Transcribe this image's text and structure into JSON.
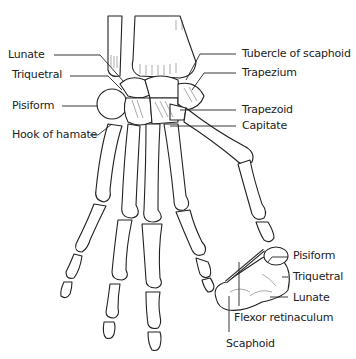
{
  "diagram": {
    "labels_left": [
      {
        "text": "Lunate",
        "x": 8,
        "y": 49
      },
      {
        "text": "Triquetral",
        "x": 12,
        "y": 69
      },
      {
        "text": "Pisiform",
        "x": 12,
        "y": 100
      },
      {
        "text": "Hook of hamate",
        "x": 12,
        "y": 129
      }
    ],
    "labels_right": [
      {
        "text": "Tubercle of scaphoid",
        "x": 242,
        "y": 48
      },
      {
        "text": "Trapezium",
        "x": 242,
        "y": 67
      },
      {
        "text": "Trapezoid",
        "x": 242,
        "y": 104
      },
      {
        "text": "Capitate",
        "x": 242,
        "y": 120
      }
    ],
    "labels_inset": [
      {
        "text": "Pisiform",
        "x": 293,
        "y": 250
      },
      {
        "text": "Triquetral",
        "x": 293,
        "y": 271
      },
      {
        "text": "Lunate",
        "x": 293,
        "y": 292
      },
      {
        "text": "Flexor retinaculum",
        "x": 234,
        "y": 312
      },
      {
        "text": "Scaphoid",
        "x": 226,
        "y": 338
      }
    ]
  }
}
